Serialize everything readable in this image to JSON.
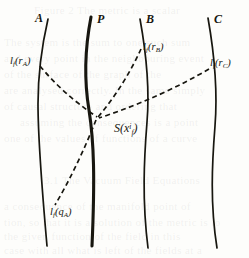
{
  "figure": {
    "caption_hidden": "",
    "background_page_text": [
      {
        "text": "Figure 2 The metric is a scalar",
        "x": 34,
        "y": 4
      },
      {
        "text": "The system is the sum to one such sum",
        "x": 4,
        "y": 36
      },
      {
        "text": "and every point in the neighbouring event",
        "x": 4,
        "y": 52
      },
      {
        "text": "of the surface of the graph of the",
        "x": 4,
        "y": 68
      },
      {
        "text": "are analysed correctly. In the same simply",
        "x": 4,
        "y": 84
      },
      {
        "text": "of causal structure and ordering that",
        "x": 4,
        "y": 100
      },
      {
        "text": "assuming the consequences is a point",
        "x": 20,
        "y": 116
      },
      {
        "text": "one of the values of functions of a curve",
        "x": 4,
        "y": 132
      },
      {
        "text": "3.1 The Vacuum Field Equations",
        "x": 44,
        "y": 174
      },
      {
        "text": "a consequence of the manifold point of",
        "x": 4,
        "y": 200
      },
      {
        "text": "tion, so that it is a solution of the metric is to",
        "x": 4,
        "y": 216
      },
      {
        "text": "the given function of the field in this",
        "x": 4,
        "y": 230
      },
      {
        "text": "case with all what is left of the fields at a",
        "x": 4,
        "y": 244
      }
    ],
    "curve_labels": [
      {
        "name": "worldline-label-A",
        "text": "A",
        "x": 35,
        "y": 12
      },
      {
        "name": "worldline-label-P",
        "text": "P",
        "x": 97,
        "y": 13
      },
      {
        "name": "worldline-label-B",
        "text": "B",
        "x": 146,
        "y": 13
      },
      {
        "name": "worldline-label-C",
        "text": "C",
        "x": 214,
        "y": 13
      }
    ],
    "function_labels": [
      {
        "name": "label-l-rA",
        "main": "l",
        "sub": "f",
        "open": "(",
        "arg": "r",
        "argsub": "A",
        "close": ")",
        "x": 10,
        "y": 56
      },
      {
        "name": "label-l-rB",
        "main": "l",
        "sub": "f",
        "open": "(",
        "arg": "r",
        "argsub": "B",
        "close": ")",
        "x": 143,
        "y": 42
      },
      {
        "name": "label-l-rC",
        "main": "l",
        "sub": "f",
        "open": "(",
        "arg": "r",
        "argsub": "C",
        "close": ")",
        "x": 210,
        "y": 58
      },
      {
        "name": "label-l-qA",
        "main": "l",
        "sub": "f",
        "open": "(",
        "arg": "q",
        "argsub": "A",
        "close": ")",
        "x": 50,
        "y": 207
      }
    ],
    "event_label": {
      "name": "event-label-S",
      "main": "S",
      "open": "(",
      "arg": "x",
      "sup": "i",
      "sub": "f",
      "close": ")",
      "x": 114,
      "y": 122
    },
    "colors": {
      "ink": "#17160f",
      "paper": "#fdfdfb",
      "ghost_text": "rgba(150,150,150,0.13)"
    },
    "worldlines": [
      {
        "name": "worldline-A",
        "id": "A",
        "stroke_width": 1.7,
        "dash": false,
        "path": "M 48 19 C 42 45, 38 72, 38 104 C 38 140, 41 178, 47 246"
      },
      {
        "name": "worldline-P",
        "id": "P",
        "stroke_width": 3.1,
        "dash": false,
        "path": "M 91 17 C 85 48, 84 80, 89 110 C 94 142, 95 178, 92 246"
      },
      {
        "name": "worldline-B",
        "id": "B",
        "stroke_width": 1.7,
        "dash": false,
        "path": "M 140 19 C 146 52, 150 86, 147 122 C 144 160, 142 200, 148 248"
      },
      {
        "name": "worldline-C",
        "id": "C",
        "stroke_width": 1.7,
        "dash": false,
        "path": "M 208 18 C 214 52, 218 88, 215 126 C 212 164, 210 204, 217 248"
      }
    ],
    "null_rays": [
      {
        "name": "null-ray-rA",
        "from": "l_f(r_A)",
        "to": "S",
        "dash": "5,3.4",
        "stroke_width": 1.7,
        "path": "M 40 66 C 55 84, 72 100, 97 117"
      },
      {
        "name": "null-ray-rB",
        "from": "l_f(r_B)",
        "to": "S",
        "dash": "5,3.4",
        "stroke_width": 1.7,
        "path": "M 141 49 C 131 71, 116 96, 98 117"
      },
      {
        "name": "null-ray-rC",
        "from": "l_f(r_C)",
        "to": "S",
        "dash": "5,3.4",
        "stroke_width": 1.7,
        "path": "M 209 69 C 180 86, 142 104, 99 118"
      },
      {
        "name": "null-ray-qA",
        "from": "S",
        "to": "l_f(q_A)",
        "dash": "5,3.4",
        "stroke_width": 1.7,
        "path": "M 96 120 C 85 148, 70 180, 55 205"
      }
    ]
  }
}
